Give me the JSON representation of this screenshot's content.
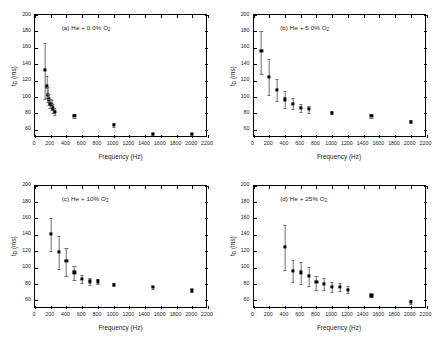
{
  "figure": {
    "panel_count": 4,
    "axis": {
      "xlabel": "Frequency (Hz)",
      "ylabel_main": "t",
      "ylabel_sub": "D",
      "ylabel_unit": " (ms)",
      "xticks": [
        0,
        200,
        400,
        600,
        800,
        1000,
        1200,
        1400,
        1600,
        1800,
        2000,
        2200
      ],
      "yticks": [
        60,
        80,
        100,
        120,
        140,
        160,
        180,
        200
      ],
      "xlim": [
        0,
        2200
      ],
      "ylim": [
        50,
        200
      ]
    }
  },
  "chart_data": [
    {
      "type": "scatter",
      "panel": "a",
      "title": "(a) He + 0.0% O₂",
      "title_main": "(a) He + 0.0% O",
      "title_sub": "2",
      "xlabel": "Frequency (Hz)",
      "ylabel": "t_D (ms)",
      "xlim": [
        0,
        2200
      ],
      "ylim": [
        50,
        200
      ],
      "grid": false,
      "x": [
        125,
        150,
        165,
        180,
        195,
        210,
        225,
        250,
        500,
        1000,
        1500,
        2000
      ],
      "y": [
        133,
        113,
        103,
        97,
        92,
        90,
        86,
        82,
        77,
        66,
        55,
        55
      ],
      "yerr_low": [
        36,
        14,
        9,
        7,
        6,
        6,
        5,
        4,
        2,
        2,
        1,
        1
      ],
      "yerr_high": [
        33,
        13,
        9,
        7,
        6,
        6,
        5,
        4,
        2,
        2,
        1,
        1
      ]
    },
    {
      "type": "scatter",
      "panel": "b",
      "title": "(b) He + 5.0% O₂",
      "title_main": "(b) He + 5.0% O",
      "title_sub": "2",
      "xlabel": "Frequency (Hz)",
      "ylabel": "t_D (ms)",
      "xlim": [
        0,
        2200
      ],
      "ylim": [
        50,
        200
      ],
      "grid": false,
      "x": [
        100,
        200,
        300,
        400,
        500,
        600,
        700,
        1000,
        1500,
        2000
      ],
      "y": [
        156,
        125,
        109,
        97,
        92,
        87,
        85,
        81,
        77,
        70
      ],
      "yerr_low": [
        28,
        23,
        14,
        10,
        7,
        5,
        4,
        2,
        2,
        2
      ],
      "yerr_high": [
        24,
        21,
        13,
        10,
        7,
        5,
        4,
        2,
        2,
        2
      ]
    },
    {
      "type": "scatter",
      "panel": "c",
      "title": "(c) He + 10% O₂",
      "title_main": "(c) He + 10% O",
      "title_sub": "2",
      "xlabel": "Frequency (Hz)",
      "ylabel": "t_D (ms)",
      "xlim": [
        0,
        2200
      ],
      "ylim": [
        50,
        200
      ],
      "grid": false,
      "x": [
        200,
        300,
        400,
        500,
        600,
        700,
        800,
        1000,
        1500,
        2000
      ],
      "y": [
        141,
        119,
        108,
        94,
        86,
        83,
        83,
        79,
        76,
        72
      ],
      "yerr_low": [
        21,
        21,
        18,
        9,
        5,
        4,
        3,
        2,
        2,
        2
      ],
      "yerr_high": [
        19,
        20,
        16,
        8,
        5,
        4,
        3,
        2,
        2,
        2
      ]
    },
    {
      "type": "scatter",
      "panel": "d",
      "title": "(d) He + 25% O₂",
      "title_main": "(d) He + 25% O",
      "title_sub": "2",
      "xlabel": "Frequency (Hz)",
      "ylabel": "t_D (ms)",
      "xlim": [
        0,
        2200
      ],
      "ylim": [
        50,
        200
      ],
      "grid": false,
      "x": [
        400,
        500,
        600,
        700,
        800,
        900,
        1000,
        1100,
        1200,
        1500,
        2000
      ],
      "y": [
        125,
        96,
        94,
        90,
        82,
        80,
        76,
        76,
        73,
        66,
        58
      ],
      "yerr_low": [
        28,
        14,
        14,
        12,
        9,
        8,
        6,
        5,
        4,
        2,
        2
      ],
      "yerr_high": [
        27,
        13,
        13,
        11,
        8,
        7,
        6,
        5,
        4,
        2,
        2
      ]
    }
  ]
}
